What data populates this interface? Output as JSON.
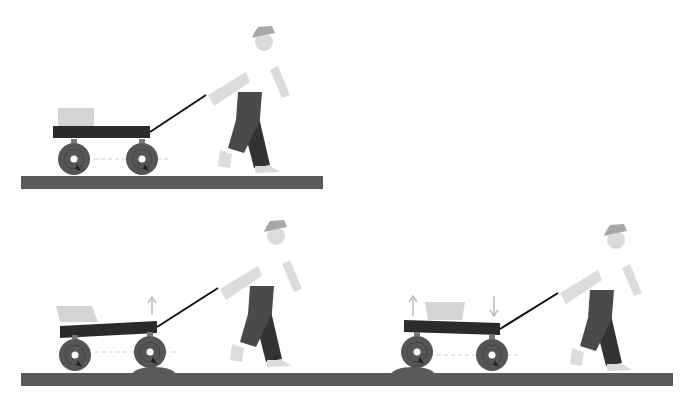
{
  "colors": {
    "background": "#ffffff",
    "ground": "#5a5a5a",
    "wagon_bed": "#2b2b2b",
    "wheel": "#555555",
    "wheel_hub": "#ffffff",
    "cargo": "#d4d4d4",
    "skin": "#dcdcdc",
    "hat": "#a8a8a8",
    "pants_front": "#4a4a4a",
    "pants_back": "#333333",
    "handle": "#111111",
    "arrow": "#bdbdbd",
    "axle_line": "#cfcfcf"
  },
  "scenes": [
    {
      "name": "level-ground",
      "ground": {
        "x": 21,
        "y": 176,
        "w": 302,
        "h": 13
      },
      "bump": null,
      "wagon": {
        "rear_wheel": [
          74,
          159
        ],
        "front_wheel": [
          142,
          159
        ],
        "wheel_r": 16,
        "bed": [
          [
            53,
            126
          ],
          [
            150,
            126
          ],
          [
            150,
            138
          ],
          [
            53,
            138
          ]
        ],
        "cargo": [
          [
            58,
            108
          ],
          [
            94,
            108
          ],
          [
            94,
            126
          ],
          [
            58,
            126
          ]
        ],
        "handle_end": [
          206,
          95
        ]
      },
      "person": {
        "x": 200,
        "y": 20
      },
      "arrows": []
    },
    {
      "name": "front-wheel-on-bump",
      "ground": {
        "x": 21,
        "y": 373,
        "w": 652,
        "h": 13
      },
      "bump": {
        "cx": 154,
        "cy": 375,
        "rx": 22,
        "ry": 8
      },
      "wagon": {
        "rear_wheel": [
          75,
          355
        ],
        "front_wheel": [
          150,
          352
        ],
        "wheel_r": 16,
        "bed": [
          [
            60,
            326
          ],
          [
            157,
            321
          ],
          [
            157,
            333
          ],
          [
            60,
            338
          ]
        ],
        "cargo": [
          [
            56,
            306
          ],
          [
            92,
            306
          ],
          [
            98,
            322
          ],
          [
            60,
            322
          ]
        ],
        "handle_end": [
          218,
          288
        ]
      },
      "person": {
        "x": 212,
        "y": 214
      },
      "arrows": [
        {
          "x": 152,
          "y1": 315,
          "y2": 297,
          "dir": "up"
        }
      ]
    },
    {
      "name": "rear-wheel-on-bump",
      "ground": null,
      "bump": {
        "cx": 413,
        "cy": 375,
        "rx": 22,
        "ry": 8
      },
      "wagon": {
        "rear_wheel": [
          417,
          352
        ],
        "front_wheel": [
          492,
          355
        ],
        "wheel_r": 16,
        "bed": [
          [
            404,
            320
          ],
          [
            500,
            323
          ],
          [
            500,
            335
          ],
          [
            404,
            332
          ]
        ],
        "cargo": [
          [
            425,
            302
          ],
          [
            465,
            302
          ],
          [
            462,
            320
          ],
          [
            428,
            320
          ]
        ],
        "handle_end": [
          558,
          293
        ]
      },
      "person": {
        "x": 552,
        "y": 218
      },
      "arrows": [
        {
          "x": 413,
          "y1": 316,
          "y2": 296,
          "dir": "up"
        },
        {
          "x": 494,
          "y1": 296,
          "y2": 316,
          "dir": "down"
        }
      ]
    }
  ]
}
